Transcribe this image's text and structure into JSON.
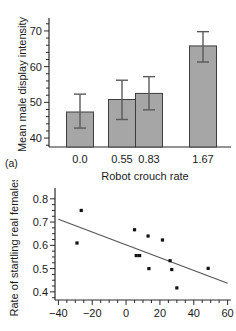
{
  "figure": {
    "panels": [
      {
        "label": "(a)"
      }
    ]
  },
  "chart_data": [
    {
      "type": "bar",
      "panel": "(a)",
      "title": "",
      "xlabel": "Robot crouch rate",
      "ylabel": "Mean male display intensity",
      "categories": [
        "0.0",
        "0.55",
        "0.83",
        "1.67"
      ],
      "values": [
        47.3,
        50.8,
        52.5,
        65.8
      ],
      "error_low": [
        42.8,
        45.2,
        47.9,
        61.3
      ],
      "error_high": [
        52.3,
        56.2,
        57.2,
        69.8
      ],
      "ytick_labels": [
        "40",
        "50",
        "60",
        "70"
      ],
      "yticks": [
        40,
        50,
        60,
        70
      ],
      "ylim": [
        37.5,
        72.5
      ],
      "grid": false,
      "legend": false,
      "bar_fill": "#a6a6a6",
      "bar_stroke": "#3d3d3d"
    },
    {
      "type": "scatter",
      "panel": "(b)",
      "title": "",
      "xlabel": "",
      "ylabel": "Rate of startling real females",
      "xtick_labels": [
        "-40",
        "-20",
        "0",
        "20",
        "40",
        "60"
      ],
      "xticks": [
        -40,
        -20,
        0,
        20,
        40,
        60
      ],
      "ytick_labels": [
        "0.4",
        "0.5",
        "0.6",
        "0.7",
        "0.8"
      ],
      "yticks": [
        0.4,
        0.5,
        0.6,
        0.7,
        0.8
      ],
      "xlim": [
        -42,
        62
      ],
      "ylim": [
        0.365,
        0.825
      ],
      "grid": false,
      "legend": false,
      "point_color": "#111111",
      "line_color": "#555555",
      "points": [
        {
          "x": -29.0,
          "y": 0.61
        },
        {
          "x": -26.5,
          "y": 0.75
        },
        {
          "x": 5.0,
          "y": 0.667
        },
        {
          "x": 6.0,
          "y": 0.556
        },
        {
          "x": 8.0,
          "y": 0.556
        },
        {
          "x": 13.0,
          "y": 0.64
        },
        {
          "x": 13.5,
          "y": 0.5
        },
        {
          "x": 21.5,
          "y": 0.623
        },
        {
          "x": 26.0,
          "y": 0.534
        },
        {
          "x": 27.0,
          "y": 0.496
        },
        {
          "x": 30.0,
          "y": 0.417
        },
        {
          "x": 48.5,
          "y": 0.501
        }
      ],
      "fit_line": {
        "x1": -40,
        "y1": 0.712,
        "x2": 60,
        "y2": 0.437
      }
    }
  ]
}
